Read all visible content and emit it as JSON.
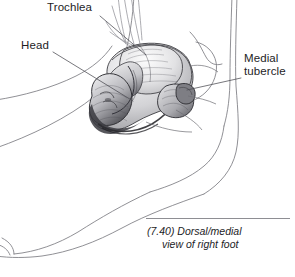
{
  "figure": {
    "kind": "anatomical-line-drawing",
    "background_color": "#ffffff",
    "ink_color": "#3c3c41",
    "outline_color": "#6e6e73",
    "text_color": "#1d1d1f",
    "rule_color": "#8e8e93"
  },
  "labels": {
    "trochlea": "Trochlea",
    "head": "Head",
    "medial_tubercle_line1": "Medial",
    "medial_tubercle_line2": "tubercle"
  },
  "caption": {
    "number": "(7.40)",
    "line1": "(7.40) Dorsal/medial",
    "line2": "view of right foot",
    "full": "(7.40) Dorsal/medial view of right foot"
  },
  "leaders": {
    "trochlea": "from label down-right to the trochlear dome",
    "head": "from label down-right to the talar head",
    "medial_tubercle": "horizontal from label left to the medial tubercle"
  }
}
